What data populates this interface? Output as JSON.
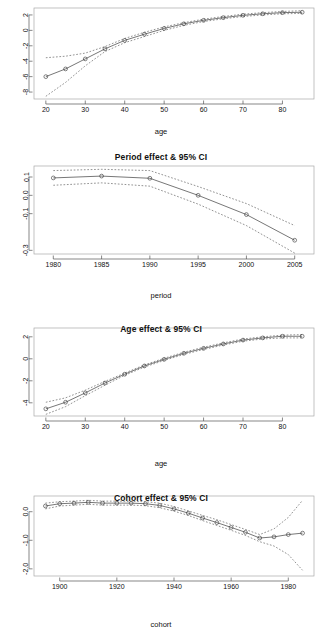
{
  "figure": {
    "panel_count": 4
  },
  "panels": [
    {
      "title": "",
      "xlabel": "age",
      "ylabel": ""
    },
    {
      "title": "Period effect & 95% CI",
      "xlabel": "period",
      "ylabel": ""
    },
    {
      "title": "Age effect & 95% CI",
      "xlabel": "age",
      "ylabel": ""
    },
    {
      "title": "Cohort effect & 95% CI",
      "xlabel": "cohort",
      "ylabel": ""
    }
  ],
  "chart_data": [
    {
      "type": "line",
      "title": "",
      "xlabel": "age",
      "ylabel": "",
      "xticks": [
        20,
        30,
        40,
        50,
        60,
        70,
        80
      ],
      "yticks": [
        2,
        0,
        -2,
        -4,
        -6,
        -8
      ],
      "xlim": [
        17,
        88
      ],
      "ylim": [
        -8.9,
        2.9
      ],
      "grid": false,
      "legend": null,
      "x": [
        20,
        25,
        30,
        35,
        40,
        45,
        50,
        55,
        60,
        65,
        70,
        75,
        80,
        85
      ],
      "series": [
        {
          "name": "estimate",
          "values": [
            -6.0,
            -5.0,
            -3.7,
            -2.4,
            -1.3,
            -0.5,
            0.25,
            0.85,
            1.3,
            1.65,
            1.95,
            2.15,
            2.3,
            2.35
          ]
        },
        {
          "name": "upper 95% CI",
          "values": [
            -3.55,
            -3.35,
            -2.95,
            -2.1,
            -1.05,
            -0.25,
            0.45,
            1.0,
            1.45,
            1.8,
            2.1,
            2.3,
            2.45,
            2.55
          ]
        },
        {
          "name": "lower 95% CI",
          "values": [
            -8.55,
            -6.75,
            -4.6,
            -2.75,
            -1.6,
            -0.8,
            0.0,
            0.65,
            1.15,
            1.5,
            1.8,
            2.0,
            2.15,
            2.2
          ]
        }
      ]
    },
    {
      "type": "line",
      "title": "Period effect & 95% CI",
      "xlabel": "period",
      "ylabel": "",
      "xticks": [
        1980,
        1985,
        1990,
        1995,
        2000,
        2005
      ],
      "yticks": [
        0.1,
        0.0,
        -0.1,
        -0.3
      ],
      "xlim": [
        1978,
        2007
      ],
      "ylim": [
        -0.32,
        0.16
      ],
      "grid": false,
      "legend": null,
      "x": [
        1980,
        1985,
        1990,
        1995,
        2000,
        2005
      ],
      "series": [
        {
          "name": "estimate",
          "values": [
            0.095,
            0.105,
            0.093,
            0.0,
            -0.105,
            -0.245
          ]
        },
        {
          "name": "upper 95% CI",
          "values": [
            0.135,
            0.142,
            0.135,
            0.048,
            -0.045,
            -0.165
          ]
        },
        {
          "name": "lower 95% CI",
          "values": [
            0.055,
            0.068,
            0.05,
            -0.048,
            -0.165,
            -0.315
          ]
        }
      ]
    },
    {
      "type": "line",
      "title": "Age effect & 95% CI",
      "xlabel": "age",
      "ylabel": "",
      "xticks": [
        20,
        30,
        40,
        50,
        60,
        70,
        80
      ],
      "yticks": [
        2,
        0,
        -2,
        -4
      ],
      "xlim": [
        17,
        88
      ],
      "ylim": [
        -5.2,
        2.8
      ],
      "grid": false,
      "legend": null,
      "x": [
        20,
        25,
        30,
        35,
        40,
        45,
        50,
        55,
        60,
        65,
        70,
        75,
        80,
        85
      ],
      "series": [
        {
          "name": "estimate",
          "values": [
            -4.55,
            -3.95,
            -3.1,
            -2.2,
            -1.4,
            -0.65,
            -0.05,
            0.5,
            0.95,
            1.35,
            1.7,
            1.9,
            2.05,
            2.05
          ]
        },
        {
          "name": "upper 95% CI",
          "values": [
            -3.95,
            -3.55,
            -2.85,
            -2.05,
            -1.3,
            -0.55,
            0.05,
            0.6,
            1.05,
            1.45,
            1.8,
            2.0,
            2.15,
            2.2
          ]
        },
        {
          "name": "lower 95% CI",
          "values": [
            -5.05,
            -4.35,
            -3.35,
            -2.4,
            -1.5,
            -0.75,
            -0.15,
            0.4,
            0.85,
            1.25,
            1.6,
            1.8,
            1.9,
            1.9
          ]
        }
      ]
    },
    {
      "type": "line",
      "title": "Cohort effect & 95% CI",
      "xlabel": "cohort",
      "ylabel": "",
      "xticks": [
        1900,
        1920,
        1940,
        1960,
        1980
      ],
      "yticks": [
        0.0,
        -1.0,
        -2.0
      ],
      "xlim": [
        1891,
        1989
      ],
      "ylim": [
        -2.25,
        0.55
      ],
      "grid": false,
      "legend": null,
      "x": [
        1895,
        1900,
        1905,
        1910,
        1915,
        1920,
        1925,
        1930,
        1935,
        1940,
        1945,
        1950,
        1955,
        1960,
        1965,
        1970,
        1975,
        1980,
        1985
      ],
      "series": [
        {
          "name": "estimate",
          "values": [
            0.2,
            0.28,
            0.3,
            0.33,
            0.3,
            0.3,
            0.3,
            0.28,
            0.22,
            0.1,
            -0.05,
            -0.22,
            -0.38,
            -0.55,
            -0.72,
            -0.92,
            -0.88,
            -0.8,
            -0.75
          ]
        },
        {
          "name": "upper 95% CI",
          "values": [
            0.3,
            0.35,
            0.37,
            0.4,
            0.37,
            0.37,
            0.36,
            0.35,
            0.3,
            0.18,
            0.03,
            -0.13,
            -0.28,
            -0.45,
            -0.62,
            -0.8,
            -0.6,
            -0.2,
            0.4
          ]
        },
        {
          "name": "lower 95% CI",
          "values": [
            0.1,
            0.2,
            0.23,
            0.26,
            0.23,
            0.23,
            0.23,
            0.21,
            0.14,
            0.02,
            -0.13,
            -0.31,
            -0.48,
            -0.65,
            -0.83,
            -1.05,
            -1.2,
            -1.5,
            -2.05
          ]
        }
      ]
    }
  ]
}
